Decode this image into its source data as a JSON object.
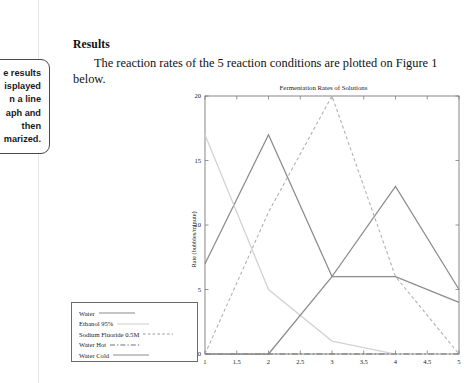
{
  "document": {
    "annotation_callout": {
      "lines": [
        "e results",
        "isplayed",
        "n a line",
        "aph and",
        "then",
        "marized."
      ],
      "full_text_clipped": "The results are displayed in a line graph and then summarized."
    },
    "heading": "Results",
    "paragraph": "The reaction rates of the 5 reaction conditions are plotted on Figure 1 below."
  },
  "chart_data": {
    "type": "line",
    "title": "Fermentation Rates of Solutions",
    "xlabel": "",
    "ylabel": "Rate (bubbles/minute)",
    "xlim": [
      1,
      5
    ],
    "ylim": [
      0,
      20
    ],
    "grid": false,
    "legend_position": "outside-left-bottom",
    "x_ticks": [
      "1",
      "1.5",
      "2",
      "2.5",
      "3",
      "3.5",
      "4",
      "4.5",
      "5"
    ],
    "x_tick_values": [
      1,
      1.5,
      2,
      2.5,
      3,
      3.5,
      4,
      4.5,
      5
    ],
    "y_ticks": [
      "0",
      "5",
      "10",
      "15",
      "20"
    ],
    "y_tick_values": [
      0,
      5,
      10,
      15,
      20
    ],
    "x": [
      1,
      2,
      3,
      4,
      5
    ],
    "series": [
      {
        "name": "Water",
        "values": [
          7,
          17,
          6,
          13,
          5
        ],
        "style": "solid",
        "color": "#8c8c8c"
      },
      {
        "name": "Ethanol 95%",
        "values": [
          17,
          5,
          1,
          0,
          0
        ],
        "style": "solid",
        "color": "#d2d2d2"
      },
      {
        "name": "Sodium Fluoride 0.5M",
        "values": [
          0,
          11,
          20,
          6,
          0
        ],
        "style": "dashed",
        "color": "#aeaeae"
      },
      {
        "name": "Water Hot",
        "values": [
          0,
          0,
          0,
          0,
          0
        ],
        "style": "dashdot",
        "color": "#6e6e6e"
      },
      {
        "name": "Water Cold",
        "values": [
          0,
          0,
          6,
          6,
          4
        ],
        "style": "solid",
        "color": "#8c8c8c"
      }
    ]
  },
  "legend": {
    "items": [
      {
        "label": "Water",
        "style": "solid"
      },
      {
        "label": "Ethanol 95%",
        "style": "solid-light"
      },
      {
        "label": "Sodium Fluoride 0.5M",
        "style": "dashed"
      },
      {
        "label": "Water Hot",
        "style": "dashdot"
      },
      {
        "label": "Water Cold",
        "style": "solid"
      }
    ]
  },
  "colors": {
    "axis": "#7a7a7a",
    "text": "#1c1c1c",
    "callout_border": "#4a4a4a"
  }
}
